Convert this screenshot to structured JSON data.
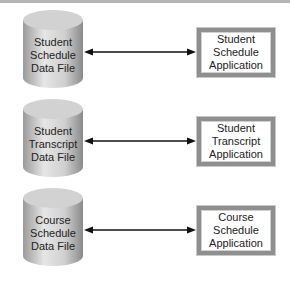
{
  "diagram": {
    "rows": [
      {
        "data_file": [
          "Student",
          "Schedule",
          "Data File"
        ],
        "application": [
          "Student",
          "Schedule",
          "Application"
        ]
      },
      {
        "data_file": [
          "Student",
          "Transcript",
          "Data File"
        ],
        "application": [
          "Student",
          "Transcript",
          "Application"
        ]
      },
      {
        "data_file": [
          "Course",
          "Schedule",
          "Data File"
        ],
        "application": [
          "Course",
          "Schedule",
          "Application"
        ]
      }
    ],
    "connector": "bidirectional-arrow",
    "colors": {
      "cylinder": "#c8c8c8",
      "box_border": "#8f8f8f",
      "arrow": "#111111"
    }
  }
}
